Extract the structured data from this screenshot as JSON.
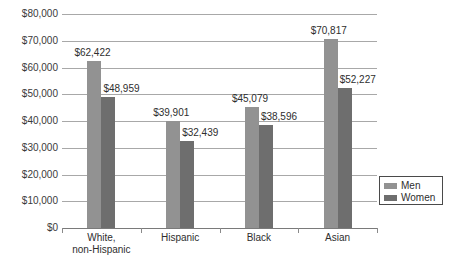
{
  "chart_data": {
    "type": "bar",
    "title": "",
    "subtitle": "",
    "xlabel": "",
    "ylabel": "",
    "categories": [
      "White, non-Hispanic",
      "Hispanic",
      "Black",
      "Asian"
    ],
    "category_lines": [
      [
        "White,",
        "non-Hispanic"
      ],
      [
        "Hispanic"
      ],
      [
        "Black"
      ],
      [
        "Asian"
      ]
    ],
    "series": [
      {
        "name": "Men",
        "color": "#929292",
        "values": [
          62422,
          39901,
          45079,
          70817
        ],
        "labels": [
          "$62,422",
          "$39,901",
          "$45,079",
          "$70,817"
        ]
      },
      {
        "name": "Women",
        "color": "#6e6e6e",
        "values": [
          48959,
          32439,
          38596,
          52227
        ],
        "labels": [
          "$48,959",
          "$32,439",
          "$38,596",
          "$52,227"
        ]
      }
    ],
    "ylim": [
      0,
      80000
    ],
    "ytick_values": [
      80000,
      70000,
      60000,
      50000,
      40000,
      30000,
      20000,
      10000,
      0
    ],
    "ytick_labels": [
      "$80,000",
      "$70,000",
      "$60,000",
      "$50,000",
      "$40,000",
      "$30,000",
      "$20,000",
      "$10,000",
      "$0"
    ],
    "grid": true,
    "legend_position": "right-lower",
    "legend_entries": [
      "Men",
      "Women"
    ]
  },
  "legend": {
    "items": [
      {
        "label": "Men",
        "color": "#929292"
      },
      {
        "label": "Women",
        "color": "#6e6e6e"
      }
    ]
  }
}
